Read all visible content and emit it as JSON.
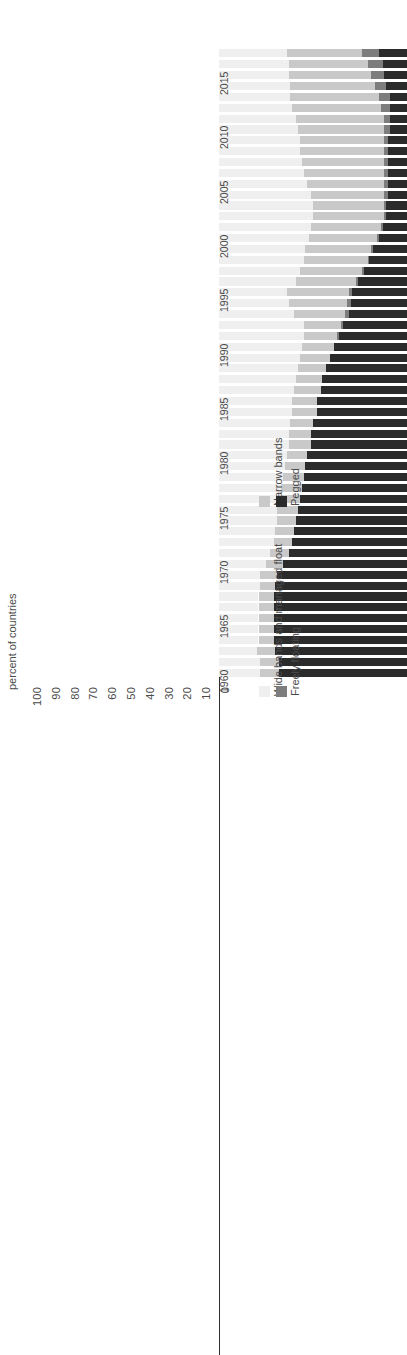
{
  "chart_data": {
    "type": "bar",
    "title": "",
    "subtitle": "",
    "orientation": "horizontal-rotated",
    "stacked": true,
    "stack_mode": "percent",
    "xlabel": "",
    "ylabel": "percent of countries",
    "ylim": [
      0,
      100
    ],
    "grid": false,
    "legend_position": "bottom-right",
    "axis_tick_labels": [
      "100",
      "90",
      "80",
      "70",
      "60",
      "50",
      "40",
      "30",
      "20",
      "10",
      "0"
    ],
    "year_tick_labels": [
      "1960",
      "1965",
      "1970",
      "1975",
      "1980",
      "1985",
      "1990",
      "1995",
      "2000",
      "2005",
      "2010",
      "2015"
    ],
    "categories_order_from_top": [
      "Wide bands and managed float",
      "Narrow bands",
      "Freely floating",
      "Pegged"
    ],
    "series": [
      {
        "name": "Wide bands and managed float",
        "color": "#efefef",
        "values": [
          22,
          22,
          20,
          21,
          21,
          21,
          21,
          21,
          22,
          22,
          25,
          27,
          29,
          30,
          31,
          31,
          32,
          33,
          34,
          35,
          36,
          37,
          37,
          38,
          39,
          39,
          40,
          41,
          42,
          43,
          44,
          45,
          45,
          40,
          37,
          36,
          41,
          43,
          45,
          46,
          48,
          49,
          50,
          50,
          49,
          47,
          45,
          44,
          43,
          43,
          42,
          41,
          39,
          38,
          38,
          37,
          37,
          36
        ]
      },
      {
        "name": "Narrow bands",
        "color": "#c9c9c9",
        "values": [
          10,
          10,
          10,
          8,
          8,
          8,
          8,
          8,
          8,
          9,
          9,
          10,
          10,
          10,
          10,
          11,
          11,
          11,
          11,
          11,
          11,
          12,
          12,
          12,
          13,
          13,
          14,
          14,
          15,
          16,
          17,
          18,
          20,
          27,
          31,
          33,
          32,
          33,
          34,
          35,
          36,
          37,
          38,
          38,
          39,
          41,
          43,
          44,
          45,
          45,
          46,
          47,
          47,
          47,
          45,
          44,
          42,
          40
        ]
      },
      {
        "name": "Freely floating",
        "color": "#7d7d7d",
        "values": [
          0,
          0,
          0,
          0,
          0,
          0,
          0,
          0,
          0,
          0,
          0,
          0,
          0,
          0,
          0,
          0,
          0,
          0,
          0,
          0,
          0,
          0,
          0,
          0,
          0,
          0,
          0,
          0,
          0,
          0,
          0,
          1,
          1,
          2,
          2,
          2,
          1,
          1,
          1,
          1,
          1,
          1,
          1,
          1,
          2,
          2,
          2,
          2,
          2,
          2,
          3,
          3,
          5,
          6,
          6,
          7,
          8,
          9
        ]
      },
      {
        "name": "Pegged",
        "color": "#2b2b2b",
        "values": [
          68,
          68,
          70,
          71,
          71,
          71,
          71,
          71,
          70,
          69,
          66,
          63,
          61,
          60,
          59,
          58,
          57,
          56,
          55,
          54,
          53,
          51,
          51,
          50,
          48,
          48,
          46,
          45,
          43,
          41,
          39,
          36,
          34,
          31,
          30,
          29,
          26,
          23,
          20,
          18,
          15,
          13,
          11,
          11,
          10,
          10,
          10,
          10,
          10,
          10,
          9,
          9,
          9,
          9,
          11,
          12,
          13,
          15
        ]
      }
    ],
    "years": [
      1960,
      1961,
      1962,
      1963,
      1964,
      1965,
      1966,
      1967,
      1968,
      1969,
      1970,
      1971,
      1972,
      1973,
      1974,
      1975,
      1976,
      1977,
      1978,
      1979,
      1980,
      1981,
      1982,
      1983,
      1984,
      1985,
      1986,
      1987,
      1988,
      1989,
      1990,
      1991,
      1992,
      1993,
      1994,
      1995,
      1996,
      1997,
      1998,
      1999,
      2000,
      2001,
      2002,
      2003,
      2004,
      2005,
      2006,
      2007,
      2008,
      2009,
      2010,
      2011,
      2012,
      2013,
      2014,
      2015,
      2016,
      2017
    ]
  },
  "axis": {
    "y_axis_title": "percent of countries"
  },
  "legend": {
    "items": [
      {
        "label": "Wide bands and managed float",
        "color": "#efefef"
      },
      {
        "label": "Narrow bands",
        "color": "#c9c9c9"
      },
      {
        "label": "Freely floating",
        "color": "#7d7d7d"
      },
      {
        "label": "Pegged",
        "color": "#2b2b2b"
      }
    ]
  }
}
